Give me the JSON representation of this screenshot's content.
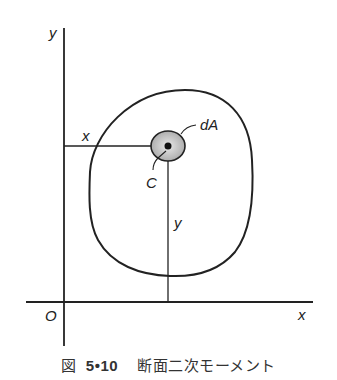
{
  "diagram": {
    "axes": {
      "y_label": "y",
      "x_label": "x",
      "origin_label": "O"
    },
    "labels": {
      "distance_x": "x",
      "distance_y": "y",
      "element_area": "dA",
      "centroid": "C"
    },
    "colors": {
      "line": "#222222",
      "element_fill": "#bdbdbd",
      "background": "#ffffff"
    }
  },
  "caption": {
    "prefix": "図",
    "number": "5•10",
    "title": "断面二次モーメント"
  }
}
